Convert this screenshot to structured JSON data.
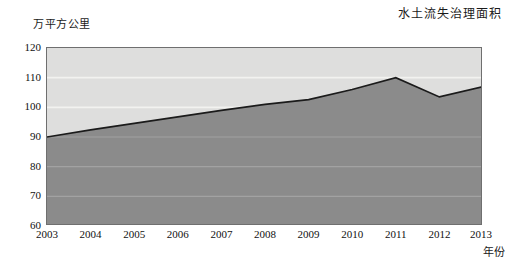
{
  "chart_data": {
    "type": "area",
    "title": "水土流失治理面积",
    "ylabel": "万平方公里",
    "xlabel": "年份",
    "categories": [
      "2003",
      "2004",
      "2005",
      "2006",
      "2007",
      "2008",
      "2009",
      "2010",
      "2011",
      "2012",
      "2013"
    ],
    "values": [
      90.0,
      92.4,
      94.6,
      96.8,
      99.0,
      101.0,
      102.6,
      106.0,
      110.0,
      103.5,
      107.0
    ],
    "ylim": [
      60,
      120
    ],
    "yticks": [
      60,
      70,
      80,
      90,
      100,
      110,
      120
    ],
    "grid": true,
    "legend": "none",
    "series_name": "水土流失治理面积",
    "colors": {
      "plot_background": "#dededd",
      "area_fill": "#8b8b8b",
      "line": "#1b1b1b",
      "gridline": "#f0f0ee",
      "frame": "#6f6f6f"
    }
  },
  "axis": {
    "y_unit_label": "万平方公里",
    "x_axis_label": "年份",
    "y_tick_labels": [
      "120",
      "110",
      "100",
      "90",
      "80",
      "70",
      "60"
    ],
    "x_tick_labels": [
      "2003",
      "2004",
      "2005",
      "2006",
      "2007",
      "2008",
      "2009",
      "2010",
      "2011",
      "2012",
      "2013"
    ]
  },
  "header": {
    "title": "水土流失治理面积"
  }
}
